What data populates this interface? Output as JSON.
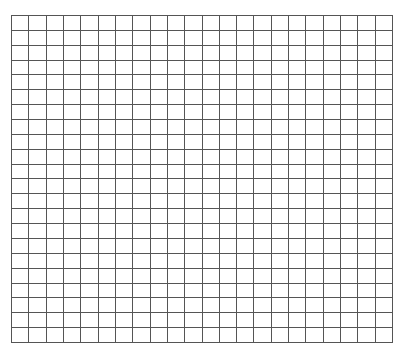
{
  "grid": {
    "columns": 22,
    "rows": 22,
    "line_color": "#555555",
    "background_color": "#ffffff",
    "cells_filled": []
  }
}
